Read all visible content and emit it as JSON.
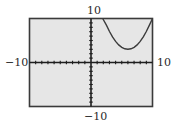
{
  "chart_data": {
    "type": "line",
    "title": "",
    "xlabel": "",
    "ylabel": "",
    "xlim": [
      -10,
      10
    ],
    "ylim": [
      -10,
      10
    ],
    "grid": false,
    "x_ticks_per_unit": 1,
    "y_ticks_per_unit": 1,
    "window_labels": {
      "xmin": "−10",
      "xmax": "10",
      "ymin": "−10",
      "ymax": "10"
    },
    "series": [
      {
        "name": "parabola",
        "equation_estimate": "y = 0.45(x - 6)^2 + 3",
        "x": [
          1.9,
          2.5,
          3,
          3.5,
          4,
          4.5,
          5,
          5.5,
          6,
          6.5,
          7,
          7.5,
          8,
          8.5,
          9,
          9.5,
          10
        ],
        "y": [
          10.6,
          8.5,
          7.05,
          5.81,
          4.8,
          4.01,
          3.45,
          3.11,
          3.0,
          3.11,
          3.45,
          4.01,
          4.8,
          5.81,
          7.05,
          8.51,
          10.2
        ]
      }
    ]
  },
  "colors": {
    "screen_bg": "#e6e6e6",
    "frame": "#3a3a3a",
    "axis": "#1e1e1e",
    "curve": "#3c3c3c",
    "label": "#2a2a2a"
  }
}
